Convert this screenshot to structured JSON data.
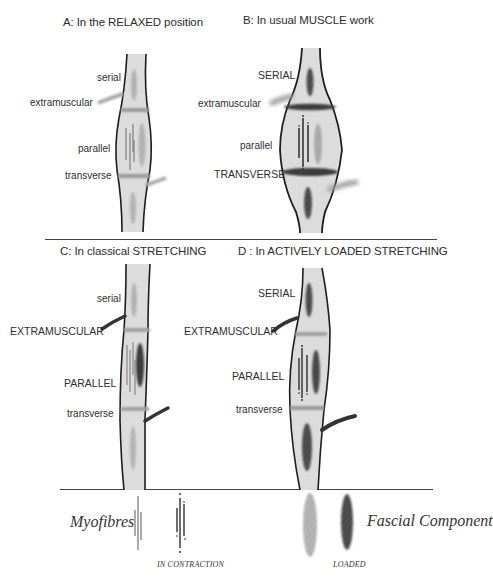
{
  "panels": {
    "A": {
      "title": "A: In the RELAXED position",
      "labels": {
        "serial": "serial",
        "extramuscular": "extramuscular",
        "parallel": "parallel",
        "transverse": "transverse"
      }
    },
    "B": {
      "title": "B: In usual MUSCLE work",
      "labels": {
        "serial": "SERIAL",
        "extramuscular": "extramuscular",
        "parallel": "parallel",
        "transverse": "TRANSVERSE"
      }
    },
    "C": {
      "title": "C: In classical STRETCHING",
      "labels": {
        "serial": "serial",
        "extramuscular": "EXTRAMUSCULAR",
        "parallel": "PARALLEL",
        "transverse": "transverse"
      }
    },
    "D": {
      "title": "D : In ACTIVELY LOADED STRETCHING",
      "labels": {
        "serial": "SERIAL",
        "extramuscular": "EXTRAMUSCULAR",
        "parallel": "PARALLEL",
        "transverse": "transverse"
      }
    }
  },
  "legend": {
    "myofibres": "Myofibres",
    "in_contraction": "IN CONTRACTION",
    "fascial_component": "Fascial Component",
    "loaded": "LOADED"
  },
  "colors": {
    "muscle_fill": "#d9d9d9",
    "outline": "#1e1e1e",
    "fascia_light": "#a8a8a8",
    "fascia_dark": "#3a3a3a"
  }
}
